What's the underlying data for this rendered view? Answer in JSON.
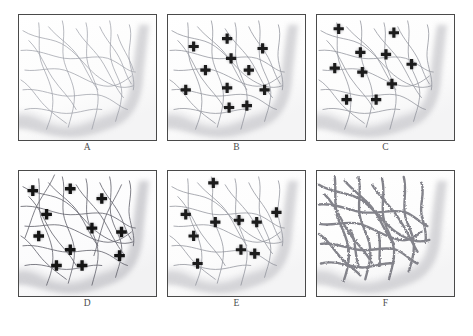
{
  "figure": {
    "caption": "",
    "background_color": "#ffffff",
    "panel_border_color": "#4a4a4a",
    "fiber_color": "#8e8e96",
    "fiber_dark_color": "#4f4f57",
    "marker_color": "#1c1c1c",
    "marker_glow_color": "#9a9a9a",
    "tissue_shadow_color": "#c9c9cd",
    "thick_vessel_color": "#7d7d85",
    "panels": [
      {
        "id": "A",
        "label": "A",
        "marker_count": 0,
        "fiber_style": "thin-light",
        "description": "Tissue region with a sparse light fiber network and no markers"
      },
      {
        "id": "B",
        "label": "B",
        "marker_count": 11,
        "fiber_style": "thin-light",
        "description": "Same fiber network with eleven cross markers placed at network nodes"
      },
      {
        "id": "C",
        "label": "C",
        "marker_count": 10,
        "fiber_style": "thin-light",
        "description": "Fiber network with ten cross markers in a redistributed pattern"
      },
      {
        "id": "D",
        "label": "D",
        "marker_count": 11,
        "fiber_style": "thin-dark",
        "description": "Darker denser fiber network with eleven cross markers"
      },
      {
        "id": "E",
        "label": "E",
        "marker_count": 9,
        "fiber_style": "thin-light",
        "description": "Fiber network with nine cross markers clustered centrally"
      },
      {
        "id": "F",
        "label": "F",
        "marker_count": 0,
        "fiber_style": "thick-beaded",
        "description": "Thickened beaded branching vessel network with no markers"
      }
    ]
  }
}
